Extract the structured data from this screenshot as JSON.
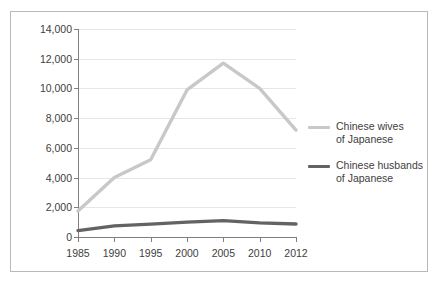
{
  "chart_data": {
    "type": "line",
    "title": "",
    "xlabel": "",
    "ylabel": "",
    "categories": [
      "1985",
      "1990",
      "1995",
      "2000",
      "2005",
      "2010",
      "2012"
    ],
    "ylim": [
      0,
      14000
    ],
    "yticks": [
      0,
      2000,
      4000,
      6000,
      8000,
      10000,
      12000,
      14000
    ],
    "ytick_labels": [
      "0",
      "2,000",
      "4,000",
      "6,000",
      "8,000",
      "10,000",
      "12,000",
      "14,000"
    ],
    "grid": "horizontal",
    "legend_position": "right",
    "series": [
      {
        "name": "Chinese wives\nof Japanese",
        "color": "#c8c8c8",
        "values": [
          1750,
          4000,
          5200,
          9900,
          11700,
          10000,
          7200
        ]
      },
      {
        "name": "Chinese husbands\nof Japanese",
        "color": "#636363",
        "values": [
          430,
          750,
          870,
          1000,
          1100,
          950,
          880
        ]
      }
    ]
  },
  "frame": {
    "border_color": "#b9b9b9",
    "background": "#ffffff",
    "gridline_color": "#e6e6e6",
    "axis_color": "#7f7f7f",
    "text_color": "#404040"
  }
}
